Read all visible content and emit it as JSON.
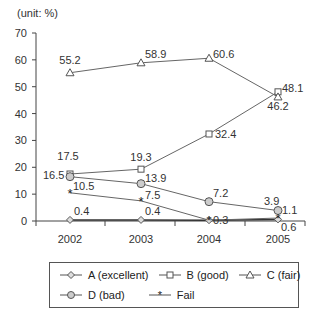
{
  "chart_data": {
    "type": "line",
    "title": "",
    "unit_label": "(unit: %)",
    "xlabel": "",
    "ylabel": "",
    "x": [
      "2002",
      "2003",
      "2004",
      "2005"
    ],
    "ylim": [
      0,
      70
    ],
    "yticks": [
      0,
      10,
      20,
      30,
      40,
      50,
      60,
      70
    ],
    "grid": false,
    "legend_position": "bottom",
    "series": [
      {
        "name": "A (excellent)",
        "marker": "diamond",
        "values": [
          0.4,
          0.4,
          0.3,
          0.6
        ]
      },
      {
        "name": "B (good)",
        "marker": "square",
        "values": [
          17.5,
          19.3,
          32.4,
          48.1
        ]
      },
      {
        "name": "C (fair)",
        "marker": "triangle",
        "values": [
          55.2,
          58.9,
          60.6,
          46.2
        ]
      },
      {
        "name": "D (bad)",
        "marker": "circle",
        "values": [
          16.5,
          13.9,
          7.2,
          3.9
        ]
      },
      {
        "name": "Fail",
        "marker": "star",
        "values": [
          10.5,
          7.5,
          0.3,
          1.1
        ]
      }
    ]
  },
  "legend": {
    "row1": [
      "A (excellent)",
      "B (good)",
      "C (fair)"
    ],
    "row2": [
      "D (bad)",
      "Fail"
    ]
  }
}
